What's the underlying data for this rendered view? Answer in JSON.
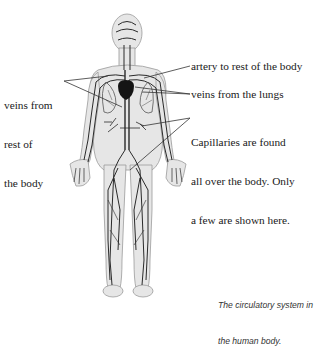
{
  "figure": {
    "colors": {
      "body_fill": "#e6e6e6",
      "body_outline": "#9a9a9a",
      "vessel": "#2a2a2a",
      "heart": "#151515",
      "leader_line": "#333333"
    }
  },
  "labels": {
    "veins_rest_body_line1": "veins from",
    "veins_rest_body_line2": "rest of",
    "veins_rest_body_line3": "the body",
    "artery": "artery to rest of the body",
    "veins_lungs": "veins from the lungs",
    "capillaries_line1": "Capillaries are found",
    "capillaries_line2": "all over the body. Only",
    "capillaries_line3": "a few are shown here."
  },
  "caption": {
    "line1": "The circulatory system in",
    "line2": "the human body."
  }
}
